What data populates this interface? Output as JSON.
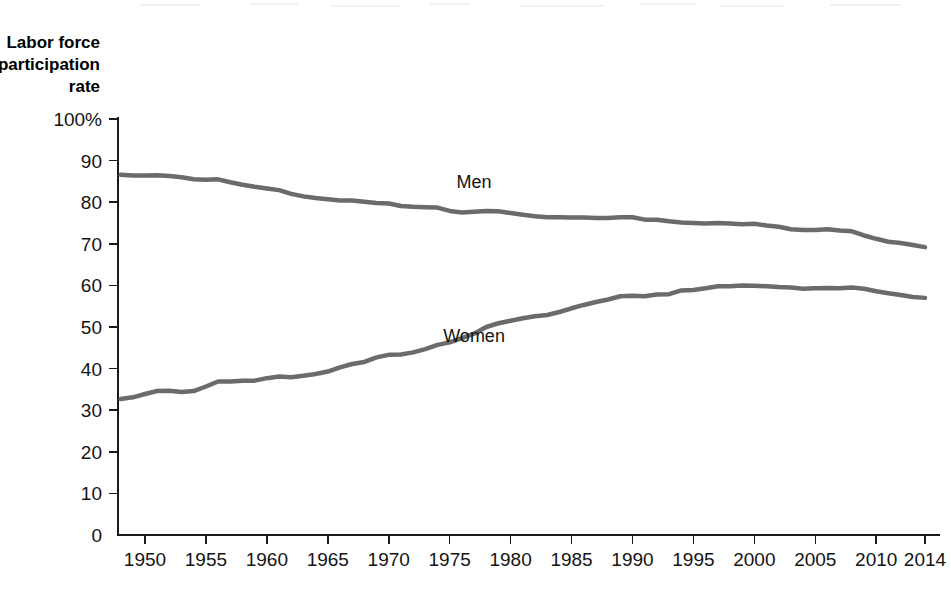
{
  "figure": {
    "background_color": "#ffffff",
    "axis_color": "#1a1a1a",
    "series_color": "#6b6b6b"
  },
  "axis_title": {
    "line1": "Labor force",
    "line2": "participation",
    "line3": "rate"
  },
  "chart_data": {
    "type": "line",
    "title": "",
    "subtitle": "",
    "xlabel": "",
    "ylabel": "Labor force participation rate",
    "xlim": [
      1948,
      2014
    ],
    "ylim": [
      0,
      100
    ],
    "grid": false,
    "legend_position": "inline-annotation",
    "y_tick_labels": [
      "100%",
      "90",
      "80",
      "70",
      "60",
      "50",
      "40",
      "30",
      "20",
      "10",
      "0"
    ],
    "y_ticks": [
      100,
      90,
      80,
      70,
      60,
      50,
      40,
      30,
      20,
      10,
      0
    ],
    "x_tick_labels": [
      "1950",
      "1955",
      "1960",
      "1965",
      "1970",
      "1975",
      "1980",
      "1985",
      "1990",
      "1995",
      "2000",
      "2005",
      "2010",
      "2014"
    ],
    "x_ticks": [
      1950,
      1955,
      1960,
      1965,
      1970,
      1975,
      1980,
      1985,
      1990,
      1995,
      2000,
      2005,
      2010,
      2014
    ],
    "annotations": [
      {
        "text": "Men",
        "x": 1977,
        "y": 83.5
      },
      {
        "text": "Women",
        "x": 1977,
        "y": 46.5
      }
    ],
    "series": [
      {
        "name": "Men",
        "label": "Men",
        "color": "#6b6b6b",
        "x": [
          1948,
          1949,
          1950,
          1951,
          1952,
          1953,
          1954,
          1955,
          1956,
          1957,
          1958,
          1959,
          1960,
          1961,
          1962,
          1963,
          1964,
          1965,
          1966,
          1967,
          1968,
          1969,
          1970,
          1971,
          1972,
          1973,
          1974,
          1975,
          1976,
          1977,
          1978,
          1979,
          1980,
          1981,
          1982,
          1983,
          1984,
          1985,
          1986,
          1987,
          1988,
          1989,
          1990,
          1991,
          1992,
          1993,
          1994,
          1995,
          1996,
          1997,
          1998,
          1999,
          2000,
          2001,
          2002,
          2003,
          2004,
          2005,
          2006,
          2007,
          2008,
          2009,
          2010,
          2011,
          2012,
          2013,
          2014
        ],
        "values": [
          86.6,
          86.4,
          86.4,
          86.5,
          86.3,
          86.0,
          85.5,
          85.4,
          85.5,
          84.8,
          84.2,
          83.7,
          83.3,
          82.9,
          82.0,
          81.4,
          81.0,
          80.7,
          80.4,
          80.4,
          80.1,
          79.8,
          79.7,
          79.1,
          78.9,
          78.8,
          78.7,
          77.9,
          77.5,
          77.7,
          77.9,
          77.8,
          77.4,
          77.0,
          76.6,
          76.4,
          76.4,
          76.3,
          76.3,
          76.2,
          76.2,
          76.4,
          76.4,
          75.8,
          75.8,
          75.4,
          75.1,
          75.0,
          74.9,
          75.0,
          74.9,
          74.7,
          74.8,
          74.4,
          74.1,
          73.5,
          73.3,
          73.3,
          73.5,
          73.2,
          73.0,
          72.0,
          71.2,
          70.5,
          70.2,
          69.7,
          69.2
        ]
      },
      {
        "name": "Women",
        "label": "Women",
        "color": "#6b6b6b",
        "x": [
          1948,
          1949,
          1950,
          1951,
          1952,
          1953,
          1954,
          1955,
          1956,
          1957,
          1958,
          1959,
          1960,
          1961,
          1962,
          1963,
          1964,
          1965,
          1966,
          1967,
          1968,
          1969,
          1970,
          1971,
          1972,
          1973,
          1974,
          1975,
          1976,
          1977,
          1978,
          1979,
          1980,
          1981,
          1982,
          1983,
          1984,
          1985,
          1986,
          1987,
          1988,
          1989,
          1990,
          1991,
          1992,
          1993,
          1994,
          1995,
          1996,
          1997,
          1998,
          1999,
          2000,
          2001,
          2002,
          2003,
          2004,
          2005,
          2006,
          2007,
          2008,
          2009,
          2010,
          2011,
          2012,
          2013,
          2014
        ],
        "values": [
          32.7,
          33.1,
          33.9,
          34.6,
          34.7,
          34.4,
          34.6,
          35.7,
          36.9,
          36.9,
          37.1,
          37.1,
          37.7,
          38.1,
          37.9,
          38.3,
          38.7,
          39.3,
          40.3,
          41.1,
          41.6,
          42.7,
          43.3,
          43.4,
          43.9,
          44.7,
          45.7,
          46.3,
          47.3,
          48.4,
          50.0,
          50.9,
          51.5,
          52.1,
          52.6,
          52.9,
          53.6,
          54.5,
          55.3,
          56.0,
          56.6,
          57.4,
          57.5,
          57.4,
          57.8,
          57.9,
          58.8,
          58.9,
          59.3,
          59.8,
          59.8,
          60.0,
          59.9,
          59.8,
          59.6,
          59.5,
          59.2,
          59.3,
          59.4,
          59.3,
          59.5,
          59.2,
          58.6,
          58.1,
          57.7,
          57.2,
          57.0
        ]
      }
    ]
  }
}
